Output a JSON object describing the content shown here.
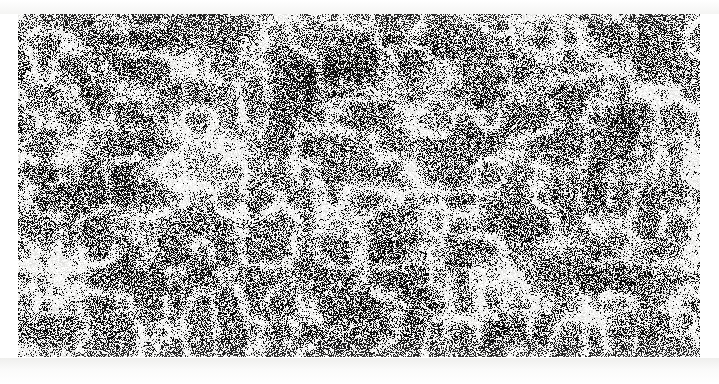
{
  "page": {
    "width": 719,
    "height": 384,
    "background_color": "#ffffff",
    "kind": "scanned-halftone-noise-plate",
    "margin_note": "",
    "caption": ""
  },
  "noise_field": {
    "name": "random-speckle-texture",
    "x": 18,
    "y": 14,
    "width": 682,
    "height": 343,
    "ink_color": "#101010",
    "paper_color": "#f2f2f0",
    "mean_gray": "#6e6e6e",
    "coverage_percent": 48,
    "grain_pixel_size": 1,
    "description": "Dense binary black-and-white dithered speckle with low-frequency cloud mottling and bright filamentary webbing.",
    "seed": 20250317,
    "cloud": {
      "octaves": 4,
      "base_cells_x": 7,
      "base_cells_y": 4,
      "contrast": 0.42,
      "bias": 0.02
    },
    "web": {
      "threshold": 0.58,
      "strength": 0.55,
      "cells_x": 26,
      "cells_y": 13
    },
    "dark_blobs": [
      {
        "cx": 0.44,
        "cy": 0.18,
        "rx": 0.09,
        "ry": 0.13,
        "amount": 0.22
      },
      {
        "cx": 0.13,
        "cy": 0.1,
        "rx": 0.07,
        "ry": 0.09,
        "amount": 0.16
      },
      {
        "cx": 0.72,
        "cy": 0.62,
        "rx": 0.1,
        "ry": 0.15,
        "amount": 0.15
      },
      {
        "cx": 0.57,
        "cy": 0.88,
        "rx": 0.08,
        "ry": 0.1,
        "amount": 0.14
      },
      {
        "cx": 0.9,
        "cy": 0.3,
        "rx": 0.07,
        "ry": 0.11,
        "amount": 0.12
      }
    ],
    "light_blobs": [
      {
        "cx": 0.27,
        "cy": 0.45,
        "rx": 0.09,
        "ry": 0.16,
        "amount": 0.18
      },
      {
        "cx": 0.62,
        "cy": 0.28,
        "rx": 0.07,
        "ry": 0.12,
        "amount": 0.14
      },
      {
        "cx": 0.05,
        "cy": 0.72,
        "rx": 0.06,
        "ry": 0.12,
        "amount": 0.15
      },
      {
        "cx": 0.83,
        "cy": 0.85,
        "rx": 0.08,
        "ry": 0.1,
        "amount": 0.13
      },
      {
        "cx": 0.47,
        "cy": 0.58,
        "rx": 0.07,
        "ry": 0.09,
        "amount": 0.11
      }
    ]
  }
}
